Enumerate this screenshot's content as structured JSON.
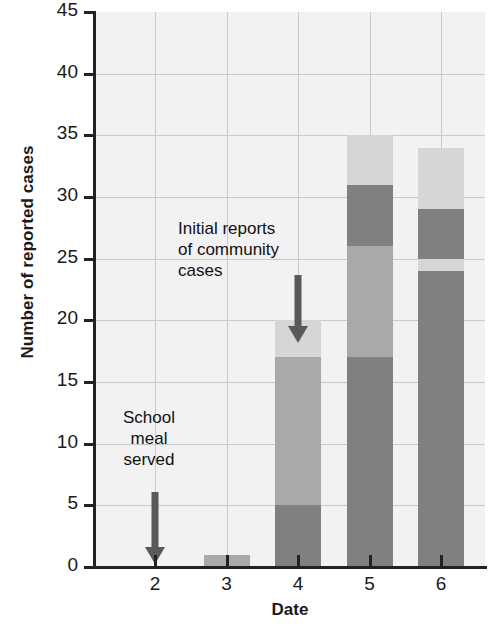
{
  "chart_data": {
    "type": "bar",
    "stacked": true,
    "title": "",
    "xlabel": "Date",
    "ylabel": "Number of reported cases",
    "categories": [
      "2",
      "3",
      "4",
      "5",
      "6"
    ],
    "totals": [
      0,
      1,
      20,
      35,
      34
    ],
    "ylim": [
      0,
      45
    ],
    "yticks": [
      "0",
      "5",
      "10",
      "15",
      "20",
      "25",
      "30",
      "35",
      "40",
      "45"
    ],
    "ytick_values": [
      0,
      5,
      10,
      15,
      20,
      25,
      30,
      35,
      40,
      45
    ],
    "xticks": [
      "2",
      "3",
      "4",
      "5",
      "6"
    ],
    "grid": "both",
    "legend": "none",
    "stacks": [
      {
        "category": "2",
        "segments": []
      },
      {
        "category": "3",
        "segments": [
          {
            "from": 0,
            "to": 1,
            "value": 1,
            "shade": "medium"
          }
        ]
      },
      {
        "category": "4",
        "segments": [
          {
            "from": 0,
            "to": 5,
            "value": 5,
            "shade": "dark"
          },
          {
            "from": 5,
            "to": 17,
            "value": 12,
            "shade": "medium"
          },
          {
            "from": 17,
            "to": 20,
            "value": 3,
            "shade": "light"
          }
        ]
      },
      {
        "category": "5",
        "segments": [
          {
            "from": 0,
            "to": 17,
            "value": 17,
            "shade": "dark"
          },
          {
            "from": 17,
            "to": 26,
            "value": 9,
            "shade": "medium"
          },
          {
            "from": 26,
            "to": 31,
            "value": 5,
            "shade": "dark"
          },
          {
            "from": 31,
            "to": 35,
            "value": 4,
            "shade": "light"
          }
        ]
      },
      {
        "category": "6",
        "segments": [
          {
            "from": 0,
            "to": 24,
            "value": 24,
            "shade": "dark"
          },
          {
            "from": 24,
            "to": 25,
            "value": 1,
            "shade": "light"
          },
          {
            "from": 25,
            "to": 29,
            "value": 4,
            "shade": "dark"
          },
          {
            "from": 29,
            "to": 34,
            "value": 5,
            "shade": "light"
          }
        ]
      }
    ],
    "annotations": [
      {
        "id": "school-meal",
        "text": "School\nmeal\nserved",
        "at_category": "2",
        "arrow": "down"
      },
      {
        "id": "community-cases",
        "text": "Initial reports\nof community\ncases",
        "at_category": "4",
        "arrow": "down"
      }
    ],
    "colors": {
      "dark": "#808080",
      "medium": "#a9a9a9",
      "light": "#d6d6d6",
      "plot_background": "#f2f2f2",
      "gridline": "#c9c9c9",
      "axis": "#222222",
      "text": "#1a1a1a",
      "arrow": "#595959"
    }
  }
}
